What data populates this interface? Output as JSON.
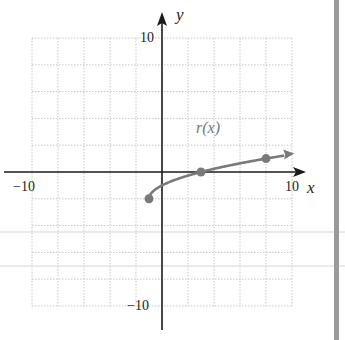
{
  "chart_data": {
    "type": "line",
    "title": "",
    "xlabel": "x",
    "ylabel": "y",
    "xlim": [
      -10,
      10
    ],
    "ylim": [
      -10,
      10
    ],
    "grid": true,
    "grid_step": 2,
    "tick_labels": {
      "x_min": "−10",
      "x_max": "10",
      "y_max": "10",
      "y_min": "−10"
    },
    "series": [
      {
        "name": "r(x)",
        "function": "sqrt(x+1) - 2",
        "domain_start": -1,
        "arrow_end": true,
        "points": [
          {
            "x": -1,
            "y": -2
          },
          {
            "x": 3,
            "y": 0
          },
          {
            "x": 8,
            "y": 1
          }
        ],
        "color": "#7a7a7a"
      }
    ],
    "annotations": [
      {
        "text": "r(x)",
        "x": 4,
        "y": 3
      }
    ]
  },
  "colors": {
    "axis": "#1a1a1a",
    "grid": "#c8c8c8",
    "curve": "#7a7a7a",
    "side_bar": "#9a9a9a",
    "scan_line": "#d4d4d4"
  }
}
